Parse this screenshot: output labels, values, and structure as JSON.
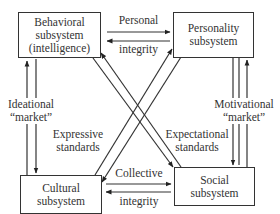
{
  "diagram": {
    "boxes": {
      "behavioral": {
        "lines": [
          "Behavioral",
          "subsystem",
          "(intelligence)"
        ]
      },
      "personality": {
        "lines": [
          "Personality",
          "subsystem"
        ]
      },
      "cultural": {
        "lines": [
          "Cultural",
          "subsystem"
        ]
      },
      "social": {
        "lines": [
          "Social",
          "subsystem"
        ]
      }
    },
    "labels": {
      "personal_integrity": {
        "top": "Personal",
        "bottom": "integrity"
      },
      "collective_integrity": {
        "top": "Collective",
        "bottom": "integrity"
      },
      "ideational_market": {
        "lines": [
          "Ideational",
          "“market”"
        ]
      },
      "motivational_market": {
        "lines": [
          "Motivational",
          "“market”"
        ]
      },
      "expressive_standards": {
        "lines": [
          "Expressive",
          "standards"
        ]
      },
      "expectational_standards": {
        "lines": [
          "Expectational",
          "standards"
        ]
      }
    },
    "colors": {
      "stroke": "#333333",
      "text": "#333333",
      "background": "#ffffff"
    }
  }
}
